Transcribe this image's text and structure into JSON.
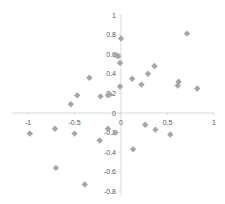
{
  "chart_data": {
    "type": "scatter",
    "title": "",
    "xlabel": "",
    "ylabel": "",
    "xlim": [
      -1.2,
      1.0
    ],
    "ylim": [
      -0.85,
      1.0
    ],
    "x_ticks": [
      "-1",
      "-0.5",
      "0",
      "0.5",
      "1"
    ],
    "y_ticks": [
      "1",
      "0.8",
      "0.6",
      "0.4",
      "0.2",
      "0",
      "-0.2",
      "-0.4",
      "-0.6",
      "-0.8"
    ],
    "grid": false,
    "legend": null,
    "marker": {
      "shape": "diamond",
      "color": "#a6a6a6"
    },
    "axis_color": "#d9d9d9",
    "series": [
      {
        "name": "Series1",
        "points": [
          [
            0.0,
            0.76
          ],
          [
            -0.05,
            0.59
          ],
          [
            -0.03,
            0.58
          ],
          [
            -0.01,
            0.51
          ],
          [
            0.12,
            0.35
          ],
          [
            0.22,
            0.29
          ],
          [
            0.29,
            0.4
          ],
          [
            0.36,
            0.48
          ],
          [
            0.71,
            0.81
          ],
          [
            0.61,
            0.28
          ],
          [
            0.62,
            0.32
          ],
          [
            0.82,
            0.25
          ],
          [
            -0.01,
            0.27
          ],
          [
            -0.34,
            0.36
          ],
          [
            -0.47,
            0.18
          ],
          [
            -0.54,
            0.09
          ],
          [
            -0.22,
            0.17
          ],
          [
            -0.14,
            0.18
          ],
          [
            -0.12,
            0.19
          ],
          [
            -0.98,
            -0.21
          ],
          [
            -0.71,
            -0.16
          ],
          [
            -0.5,
            -0.21
          ],
          [
            -0.23,
            -0.28
          ],
          [
            -0.14,
            -0.16
          ],
          [
            -0.06,
            -0.2
          ],
          [
            0.26,
            -0.12
          ],
          [
            0.37,
            -0.17
          ],
          [
            0.53,
            -0.22
          ],
          [
            0.13,
            -0.37
          ],
          [
            -0.7,
            -0.56
          ],
          [
            -0.39,
            -0.73
          ]
        ]
      }
    ]
  }
}
